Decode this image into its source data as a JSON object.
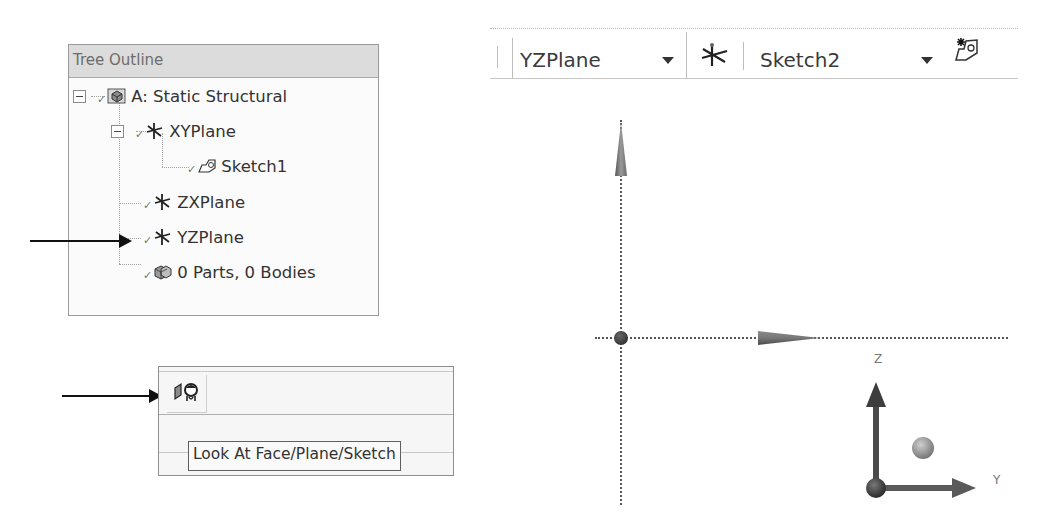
{
  "tree_outline": {
    "title": "Tree Outline",
    "items": [
      {
        "label": "A: Static Structural",
        "icon": "model-icon",
        "level": 0,
        "expanded": true
      },
      {
        "label": "XYPlane",
        "icon": "plane-icon",
        "level": 1,
        "expanded": true
      },
      {
        "label": "Sketch1",
        "icon": "sketch-icon",
        "level": 2
      },
      {
        "label": "ZXPlane",
        "icon": "plane-icon",
        "level": 1
      },
      {
        "label": "YZPlane",
        "icon": "plane-icon",
        "level": 1,
        "highlighted_by_arrow": true
      },
      {
        "label": "0 Parts, 0 Bodies",
        "icon": "parts-bodies-icon",
        "level": 1
      }
    ]
  },
  "look_at_toolbar": {
    "button_icon": "look-at-icon",
    "tooltip": "Look At Face/Plane/Sketch"
  },
  "sketching_toolbar": {
    "plane_selector": {
      "value": "YZPlane"
    },
    "new_plane_icon": "new-plane-icon",
    "sketch_selector": {
      "value": "Sketch2"
    },
    "new_sketch_icon": "new-sketch-icon"
  },
  "viewport": {
    "triad": {
      "up_axis": "Z",
      "right_axis": "Y"
    }
  },
  "colors": {
    "panel_header": "#dcdcdc",
    "panel_border": "#9a9a9a",
    "text": "#333333",
    "axis": "#555555",
    "arrow": "#111111"
  }
}
